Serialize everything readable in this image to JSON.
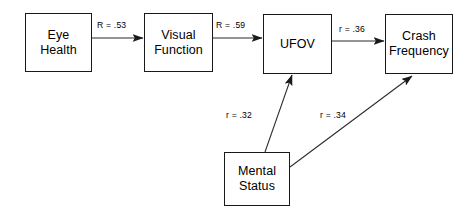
{
  "diagram": {
    "type": "path-model",
    "background_color": "#ffffff",
    "line_color": "#2b2b2b",
    "text_color": "#000000",
    "nodes": [
      {
        "id": "eye_health",
        "lines": [
          "Eye",
          "Health"
        ],
        "x": 25,
        "y": 13,
        "w": 67,
        "h": 59
      },
      {
        "id": "visual_function",
        "lines": [
          "Visual",
          "Function"
        ],
        "x": 144,
        "y": 13,
        "w": 69,
        "h": 59
      },
      {
        "id": "ufov",
        "lines": [
          "UFOV"
        ],
        "x": 263,
        "y": 14,
        "w": 69,
        "h": 60
      },
      {
        "id": "crash_frequency",
        "lines": [
          "Crash",
          "Frequency"
        ],
        "x": 385,
        "y": 14,
        "w": 68,
        "h": 60
      },
      {
        "id": "mental_status",
        "lines": [
          "Mental",
          "Status"
        ],
        "x": 224,
        "y": 152,
        "w": 66,
        "h": 54
      }
    ],
    "edges": [
      {
        "id": "eye-to-visual",
        "from": "eye_health",
        "to": "visual_function",
        "label": "R = .53",
        "label_x": 97,
        "label_y": 20,
        "x1": 92,
        "y1": 38,
        "x2": 144,
        "y2": 38
      },
      {
        "id": "visual-to-ufov",
        "from": "visual_function",
        "to": "ufov",
        "label": "R = .59",
        "label_x": 216,
        "label_y": 20,
        "x1": 213,
        "y1": 38,
        "x2": 263,
        "y2": 38
      },
      {
        "id": "ufov-to-crash",
        "from": "ufov",
        "to": "crash_frequency",
        "label": "r = .36",
        "label_x": 339,
        "label_y": 24,
        "x1": 332,
        "y1": 41,
        "x2": 385,
        "y2": 41
      },
      {
        "id": "mental-to-ufov",
        "from": "mental_status",
        "to": "ufov",
        "label": "r = .32",
        "label_x": 226,
        "label_y": 110,
        "x1": 265,
        "y1": 152,
        "x2": 292,
        "y2": 74
      },
      {
        "id": "mental-to-crash",
        "from": "mental_status",
        "to": "crash_frequency",
        "label": "r = .34",
        "label_x": 320,
        "label_y": 110,
        "x1": 290,
        "y1": 167,
        "x2": 413,
        "y2": 74
      }
    ]
  }
}
